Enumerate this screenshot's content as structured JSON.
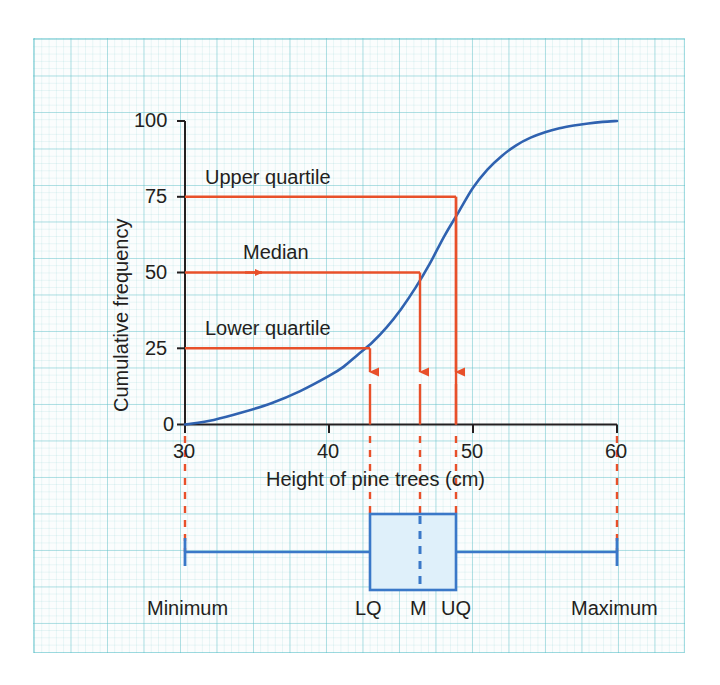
{
  "figure": {
    "background_color": "#fbfdfd",
    "grid_color": "#5abec8",
    "curve_color": "#2f62b0",
    "annotation_color": "#e8502a",
    "box_color": "#3a78c8",
    "box_fill": "#dff0fa",
    "axis_color": "#231f20"
  },
  "chart_data": {
    "type": "line",
    "title": "",
    "subtitle": "",
    "xlabel": "Height of pine trees (cm)",
    "ylabel": "Cumulative frequency",
    "xlim": [
      30,
      60
    ],
    "ylim": [
      0,
      100
    ],
    "xticks": [
      30,
      40,
      50,
      60
    ],
    "xtick_labels": [
      "30",
      "40",
      "50",
      "60"
    ],
    "yticks": [
      0,
      25,
      50,
      75,
      100
    ],
    "ytick_labels": [
      "0",
      "25",
      "50",
      "75",
      "100"
    ],
    "grid": true,
    "legend": "none",
    "series": [
      {
        "name": "Cumulative frequency curve",
        "color": "#2f62b0",
        "x": [
          30,
          32,
          34,
          36,
          38,
          40,
          41,
          42,
          43,
          44,
          45,
          46,
          47,
          48,
          49,
          50,
          51,
          52,
          53,
          54,
          55,
          56,
          57,
          58,
          59,
          60
        ],
        "y": [
          0,
          1.5,
          4,
          7,
          11,
          16,
          19,
          23,
          27,
          32,
          38,
          45,
          53,
          62,
          70,
          78,
          84,
          88.5,
          92,
          94.5,
          96.3,
          97.6,
          98.5,
          99.2,
          99.7,
          100
        ]
      }
    ],
    "annotations": [
      {
        "name": "upper-quartile",
        "label": "Upper quartile",
        "cf": 75,
        "height": 48.8
      },
      {
        "name": "median",
        "label": "Median",
        "cf": 50,
        "height": 46.3
      },
      {
        "name": "lower-quartile",
        "label": "Lower quartile",
        "cf": 25,
        "height": 42.8
      }
    ]
  },
  "boxplot": {
    "minimum": 30,
    "lower_quartile": 42.8,
    "median": 46.3,
    "upper_quartile": 48.8,
    "maximum": 60,
    "labels": {
      "minimum": "Minimum",
      "lower_quartile": "LQ",
      "median": "M",
      "upper_quartile": "UQ",
      "maximum": "Maximum"
    }
  },
  "axis_labels": {
    "x_title": "Height of pine trees (cm)",
    "y_title": "Cumulative frequency",
    "x_ticks": [
      "30",
      "40",
      "50",
      "60"
    ],
    "y_ticks": [
      "0",
      "25",
      "50",
      "75",
      "100"
    ]
  },
  "annotation_labels": {
    "upper_quartile": "Upper quartile",
    "median": "Median",
    "lower_quartile": "Lower quartile"
  }
}
